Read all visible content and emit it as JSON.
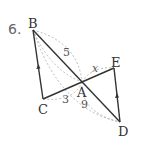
{
  "problem_number": "6.",
  "points": {
    "B": {
      "label": "B",
      "x": 33,
      "y": 30
    },
    "C": {
      "label": "C",
      "x": 43,
      "y": 99
    },
    "A": {
      "label": "A",
      "x": 82,
      "y": 82
    },
    "E": {
      "label": "E",
      "x": 114,
      "y": 68
    },
    "D": {
      "label": "D",
      "x": 120,
      "y": 122
    }
  },
  "measures": {
    "BA": "5",
    "AE": "x",
    "CA": "3",
    "AD": "9"
  },
  "colors": {
    "line": "#333333",
    "dashed": "#999999",
    "text": "#444444"
  }
}
